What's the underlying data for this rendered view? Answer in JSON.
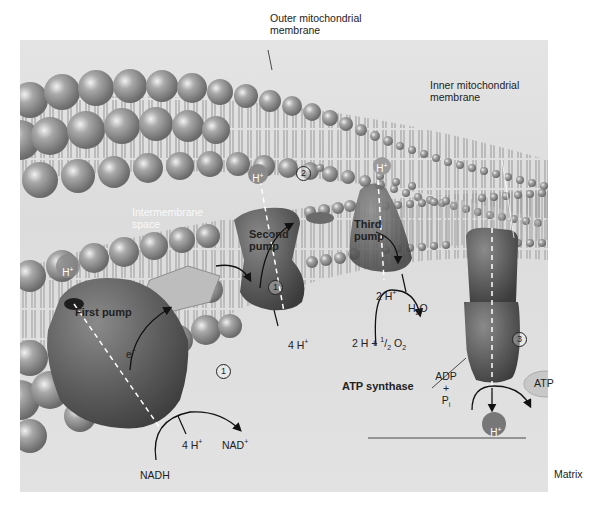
{
  "figure": {
    "labels": {
      "outer_membrane": "Outer mitochondrial membrane",
      "outer_membrane_l1": "Outer mitochondrial",
      "outer_membrane_l2": "membrane",
      "inner_membrane_l1": "Inner mitochondrial",
      "inner_membrane_l2": "membrane",
      "intermembrane_l1": "Intermembrane",
      "intermembrane_l2": "space",
      "matrix": "Matrix",
      "first_pump": "First pump",
      "second_pump_l1": "Second",
      "second_pump_l2": "pump",
      "third_pump_l1": "Third",
      "third_pump_l2": "pump",
      "atp_synthase": "ATP synthase"
    },
    "chemistry": {
      "electron": "e",
      "electron_sup": "−",
      "nadh": "NADH",
      "nad_plus": "NAD",
      "nad_sup": "+",
      "first_4h": "4 H",
      "second_4h": "4 H",
      "third_2h": "2 H",
      "h_sup": "+",
      "h2o_h": "H",
      "h2o_sub": "2",
      "h2o_o": "O",
      "oxygen_reactant_prefix": "2 H + ",
      "oxygen_frac_num": "1",
      "oxygen_frac_den": "2",
      "oxygen_o": " O",
      "oxygen_sub": "2",
      "adp": "ADP",
      "plus": "+",
      "pi": "P",
      "pi_sub": "i",
      "atp": "ATP",
      "h_ion": "H",
      "h_ion_sup": "+"
    },
    "step_markers": {
      "step1_a": "1",
      "step1_b": "1",
      "step2": "2",
      "step3": "3"
    },
    "colors": {
      "background": "#ffffff",
      "stage": "#dedede",
      "phospholipid_head": "#9a9a9a",
      "protein": "#5e5e5e",
      "atp_ellipse": "#c8c8c8",
      "h_ion": "#777777"
    }
  }
}
